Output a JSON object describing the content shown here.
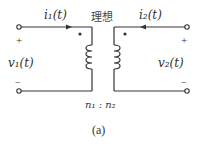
{
  "diagram": {
    "type": "ideal-transformer-circuit",
    "ideal_label": "理想",
    "primary_current": "i₁(t)",
    "secondary_current": "i₂(t)",
    "primary_voltage": "v₁(t)",
    "secondary_voltage": "v₂(t)",
    "plus_sign": "+",
    "minus_sign": "−",
    "turns_ratio": "n₁ : n₂",
    "caption": "(a)",
    "colors": {
      "line": "#333333",
      "background": "#ffffff"
    }
  }
}
